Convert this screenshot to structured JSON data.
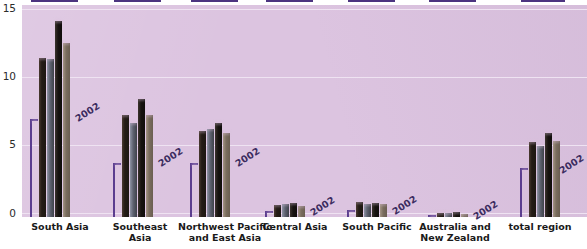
{
  "chart_data": {
    "type": "bar",
    "title": "",
    "xlabel": "",
    "ylabel": "",
    "ylim": [
      0,
      15
    ],
    "yticks": [
      "0",
      "5",
      "10",
      "15"
    ],
    "ytick_values": [
      0,
      5,
      10,
      15
    ],
    "grid": true,
    "legend_position": "none",
    "categories": [
      "South Asia",
      "Southeast Asia",
      "Northwest Pacific and East Asia",
      "Central Asia",
      "South Pacific",
      "Australia and New Zealand",
      "total region"
    ],
    "series": [
      {
        "name": "2002 reference",
        "values": [
          7.2,
          4.0,
          4.0,
          0.45,
          0.5,
          0.15,
          3.6
        ]
      },
      {
        "name": "bar-1",
        "values": [
          11.7,
          7.5,
          6.3,
          0.9,
          1.1,
          0.3,
          5.5
        ]
      },
      {
        "name": "bar-2",
        "values": [
          11.6,
          6.9,
          6.5,
          0.95,
          0.95,
          0.3,
          5.2
        ]
      },
      {
        "name": "bar-3",
        "values": [
          14.4,
          8.7,
          6.9,
          1.0,
          1.05,
          0.35,
          6.2
        ]
      },
      {
        "name": "bar-4",
        "values": [
          12.8,
          7.5,
          6.2,
          0.8,
          0.95,
          0.25,
          5.6
        ]
      }
    ],
    "annotations": [
      {
        "text": "2002",
        "category": "South Asia"
      },
      {
        "text": "2002",
        "category": "Southeast Asia"
      },
      {
        "text": "2002",
        "category": "Northwest Pacific and East Asia"
      },
      {
        "text": "2002",
        "category": "Central Asia"
      },
      {
        "text": "2002",
        "category": "South Pacific"
      },
      {
        "text": "2002",
        "category": "Australia and New Zealand"
      },
      {
        "text": "2002",
        "category": "total region"
      }
    ]
  },
  "axis": {
    "tick_0": "0",
    "tick_5": "5",
    "tick_10": "10",
    "tick_15": "15"
  },
  "categories_display": [
    {
      "line1": "South Asia",
      "line2": ""
    },
    {
      "line1": "Southeast",
      "line2": "Asia"
    },
    {
      "line1": "Northwest Pacific",
      "line2": "and East Asia"
    },
    {
      "line1": "Central Asia",
      "line2": ""
    },
    {
      "line1": "South Pacific",
      "line2": ""
    },
    {
      "line1": "Australia and",
      "line2": "New Zealand"
    },
    {
      "line1": "total region",
      "line2": ""
    }
  ],
  "annotation_labels": {
    "a0": "2002",
    "a1": "2002",
    "a2": "2002",
    "a3": "2002",
    "a4": "2002",
    "a5": "2002",
    "a6": "2002"
  },
  "colors": {
    "plot_background": "#dcc4e0",
    "reference_purple": "#5b3d8f",
    "bar_1": "#241c16",
    "bar_2": "#5e6270",
    "bar_3": "#171310",
    "bar_4": "#7a6d5e",
    "gridline": "#efe3f2"
  }
}
